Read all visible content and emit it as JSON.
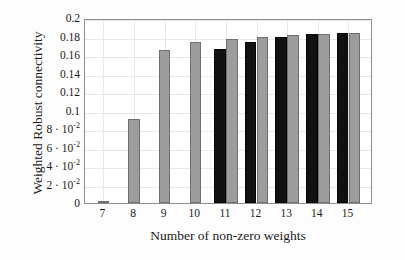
{
  "chart_data": {
    "type": "bar",
    "title": "",
    "xlabel": "Number of non-zero weights",
    "ylabel": "Weighted Robust connectivity",
    "categories": [
      "7",
      "8",
      "9",
      "10",
      "11",
      "12",
      "13",
      "14",
      "15"
    ],
    "x": [
      7,
      8,
      9,
      10,
      11,
      12,
      13,
      14,
      15
    ],
    "series": [
      {
        "name": "black",
        "color": "#111111",
        "values": [
          0,
          0,
          0,
          0,
          0.167,
          0.174,
          0.179,
          0.1825,
          0.184
        ]
      },
      {
        "name": "gray",
        "color": "#9c9c9c",
        "values": [
          0.0015,
          0.0905,
          0.165,
          0.174,
          0.1775,
          0.18,
          0.1815,
          0.1828,
          0.184
        ]
      }
    ],
    "ylim": [
      0,
      0.2
    ],
    "xlim": [
      6.4,
      15.8
    ],
    "ytick_values": [
      0,
      0.02,
      0.04,
      0.06,
      0.08,
      0.1,
      0.12,
      0.14,
      0.16,
      0.18,
      0.2
    ],
    "ytick_labels": [
      "0",
      "2 · 10<sup>-2</sup>",
      "4 · 10<sup>-2</sup>",
      "6 · 10<sup>-2</sup>",
      "8 · 10<sup>-2</sup>",
      "0.1",
      "0.12",
      "0.14",
      "0.16",
      "0.18",
      "0.2"
    ],
    "xtick_labels": [
      "7",
      "8",
      "9",
      "10",
      "11",
      "12",
      "13",
      "14",
      "15"
    ],
    "grid": true,
    "legend_position": "none",
    "axis_color": "#8e8e8e",
    "grid_color": "#e8e8e8",
    "background": "#ffffff"
  }
}
